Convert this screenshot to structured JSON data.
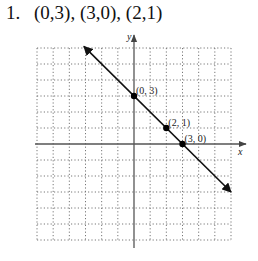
{
  "problem": {
    "number": "1.",
    "text": "(0,3),  (3,0),  (2,1)"
  },
  "chart_data": {
    "type": "line",
    "title": "",
    "xlabel": "x",
    "ylabel": "y",
    "xlim": [
      -6,
      6
    ],
    "ylim": [
      -6,
      6
    ],
    "grid": true,
    "grid_style": "dotted",
    "grid_step": 1,
    "legend": null,
    "line": {
      "description": "y = -x + 3 (arrows on both ends)",
      "from": [
        -3.1,
        6.1
      ],
      "to": [
        6,
        -3
      ]
    },
    "points": [
      {
        "x": 0,
        "y": 3,
        "label": "(0, 3)"
      },
      {
        "x": 2,
        "y": 1,
        "label": "(2, 1)"
      },
      {
        "x": 3,
        "y": 0,
        "label": "(3, 0)"
      }
    ]
  },
  "colors": {
    "grid": "#777777",
    "axis": "#555555",
    "line": "#111111",
    "point": "#000000"
  }
}
